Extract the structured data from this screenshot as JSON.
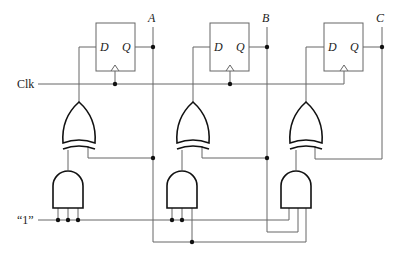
{
  "diagram": {
    "type": "synchronous 3-bit counter logic circuit",
    "flip_flops": [
      {
        "id": "ff1",
        "d_label": "D",
        "q_label": "Q",
        "output_label": "A"
      },
      {
        "id": "ff2",
        "d_label": "D",
        "q_label": "Q",
        "output_label": "B"
      },
      {
        "id": "ff3",
        "d_label": "D",
        "q_label": "Q",
        "output_label": "C"
      }
    ],
    "inputs": {
      "clock_label": "Clk",
      "constant_label": "“1”"
    },
    "gates": {
      "xor": [
        "xor1",
        "xor2",
        "xor3"
      ],
      "and": [
        "and1",
        "and2",
        "and3"
      ]
    },
    "colors": {
      "wire": "#666666",
      "gate": "#111111",
      "background": "#ffffff"
    }
  }
}
